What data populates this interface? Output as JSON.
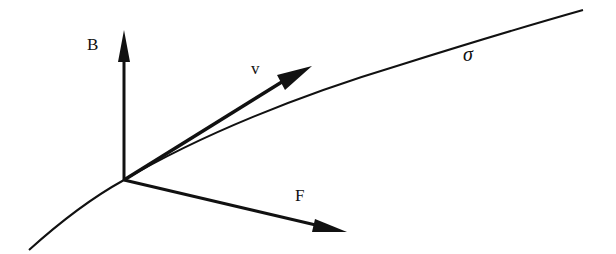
{
  "diagram": {
    "labels": {
      "B": "B",
      "v": "v",
      "sigma": "σ",
      "F": "F"
    },
    "colors": {
      "stroke": "#111111",
      "background": "#ffffff"
    },
    "elements": [
      {
        "id": "curve-sigma",
        "type": "curve",
        "label": "σ"
      },
      {
        "id": "vector-B",
        "type": "arrow",
        "label": "B",
        "direction": "up"
      },
      {
        "id": "vector-v",
        "type": "arrow",
        "label": "v",
        "direction": "tangent to curve"
      },
      {
        "id": "vector-F",
        "type": "arrow",
        "label": "F",
        "direction": "down-right"
      }
    ]
  }
}
